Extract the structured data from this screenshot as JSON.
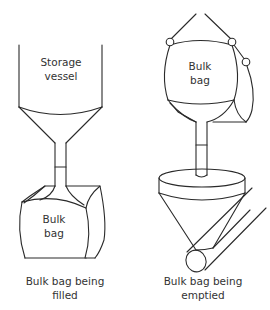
{
  "diagram": {
    "filling": {
      "vessel_label_line1": "Storage",
      "vessel_label_line2": "vessel",
      "bag_label_line1": "Bulk",
      "bag_label_line2": "bag",
      "caption_line1": "Bulk bag being",
      "caption_line2": "filled"
    },
    "emptying": {
      "bag_label_line1": "Bulk",
      "bag_label_line2": "bag",
      "caption_line1": "Bulk bag being",
      "caption_line2": "emptied"
    },
    "colors": {
      "line": "#2a2a2a",
      "text": "#333333",
      "background": "#ffffff"
    }
  }
}
